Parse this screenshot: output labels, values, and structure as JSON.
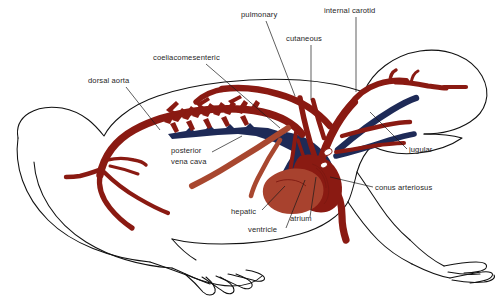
{
  "figure": {
    "view": "lateral",
    "background_color": "#ffffff",
    "width": 503,
    "height": 298
  },
  "colors": {
    "artery": "#8a1a12",
    "vein": "#1e2a57",
    "ventricle": "#a8422e",
    "hepatic": "#a8472f",
    "outline": "#111111",
    "leader_line": "#1a1a1a",
    "label_text": "#262626"
  },
  "labels": [
    {
      "id": "pulmonary",
      "text": "pulmonary",
      "x": 241,
      "y": 17,
      "anchor": "start",
      "leader": "M 266 21 L 295 96",
      "vessel_type": "artery"
    },
    {
      "id": "internal-carotid",
      "text": "internal carotid",
      "x": 324,
      "y": 13,
      "anchor": "start",
      "leader": "M 356 17 L 356 92",
      "vessel_type": "artery"
    },
    {
      "id": "cutaneous",
      "text": "cutaneous",
      "x": 286,
      "y": 41,
      "anchor": "start",
      "leader": "M 311 45 L 311 100",
      "vessel_type": "artery"
    },
    {
      "id": "coeliacomesenteric",
      "text": "coeliacomesenteric",
      "x": 153,
      "y": 60,
      "anchor": "start",
      "leader": "M 206 64 L 280 128",
      "vessel_type": "artery"
    },
    {
      "id": "dorsal-aorta",
      "text": "dorsal aorta",
      "x": 88,
      "y": 83,
      "anchor": "start",
      "leader": "M 126 87 L 160 130",
      "vessel_type": "artery"
    },
    {
      "id": "posterior-vena-cava",
      "text": "posterior vena cava",
      "lines": [
        "posterior",
        "vena cava"
      ],
      "x": 171,
      "y": 153,
      "anchor": "start",
      "leader": "M 212 152 L 242 136",
      "vessel_type": "vein"
    },
    {
      "id": "jugular",
      "text": "jugular",
      "x": 409,
      "y": 152,
      "anchor": "start",
      "leader": "M 407 149 L 370 112",
      "vessel_type": "vein"
    },
    {
      "id": "conus-arteriosus",
      "text": "conus arteriosus",
      "x": 375,
      "y": 190,
      "anchor": "start",
      "leader": "M 373 187 L 330 177",
      "vessel_type": "artery"
    },
    {
      "id": "hepatic",
      "text": "hepatic",
      "x": 231,
      "y": 214,
      "anchor": "start",
      "leader": "M 262 210 L 285 186",
      "vessel_type": "vein"
    },
    {
      "id": "ventricle",
      "text": "ventricle",
      "x": 248,
      "y": 232,
      "anchor": "start",
      "leader": "M 286 228 L 305 180",
      "vessel_type": "chamber"
    },
    {
      "id": "atrium",
      "text": "atrium",
      "x": 290,
      "y": 221,
      "anchor": "start",
      "leader": "M 310 217 L 316 177",
      "vessel_type": "chamber"
    }
  ],
  "structures": [
    {
      "id": "frog-body-outline",
      "name": "frog body outline",
      "color": "#111111"
    },
    {
      "id": "dorsal-aorta-vessel",
      "name": "dorsal aorta",
      "color": "#8a1a12"
    },
    {
      "id": "segmental-branches",
      "name": "segmental arterial branches",
      "color": "#8a1a12"
    },
    {
      "id": "iliac-branches",
      "name": "iliac arterial branches",
      "color": "#8a1a12"
    },
    {
      "id": "coeliacomesenteric-vessel",
      "name": "coeliacomesenteric artery",
      "color": "#8a1a12"
    },
    {
      "id": "posterior-vena-cava-vessel",
      "name": "posterior vena cava",
      "color": "#1e2a57"
    },
    {
      "id": "hepatic-vessel",
      "name": "hepatic vein",
      "color": "#a8472f"
    },
    {
      "id": "pulmonary-vessel",
      "name": "pulmonary artery",
      "color": "#8a1a12"
    },
    {
      "id": "cutaneous-vessel",
      "name": "cutaneous artery",
      "color": "#8a1a12"
    },
    {
      "id": "internal-carotid-vessel",
      "name": "internal carotid artery",
      "color": "#8a1a12"
    },
    {
      "id": "jugular-vessel",
      "name": "jugular vein",
      "color": "#1e2a57"
    },
    {
      "id": "conus-arteriosus-vessel",
      "name": "conus arteriosus",
      "color": "#8a1a12"
    },
    {
      "id": "atrium-chamber",
      "name": "atrium",
      "color": "#8a1a12"
    },
    {
      "id": "ventricle-chamber",
      "name": "ventricle",
      "color": "#a8422e"
    }
  ]
}
